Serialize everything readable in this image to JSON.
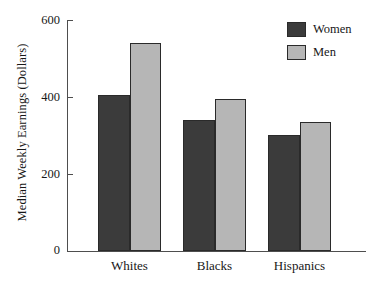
{
  "chart_data": {
    "type": "bar",
    "title": "",
    "xlabel": "",
    "ylabel": "Median Weekly Earnings (Dollars)",
    "categories": [
      "Whites",
      "Blacks",
      "Hispanics"
    ],
    "series": [
      {
        "name": "Women",
        "color": "#3b3b3b",
        "values": [
          405,
          340,
          302
        ]
      },
      {
        "name": "Men",
        "color": "#b6b6b6",
        "values": [
          540,
          395,
          335
        ]
      }
    ],
    "ylim": [
      0,
      600
    ],
    "yticks": [
      0,
      200,
      400,
      600
    ],
    "ytick_labels": [
      "0",
      "200",
      "400",
      "600"
    ],
    "grid": false,
    "legend_position": "top-right",
    "legend_entries": [
      "Women",
      "Men"
    ]
  },
  "axis": {
    "y_title": "Median Weekly Earnings (Dollars)",
    "tick_600": "600",
    "tick_400": "400",
    "tick_200": "200",
    "tick_0": "0"
  },
  "categories": {
    "c0": "Whites",
    "c1": "Blacks",
    "c2": "Hispanics"
  },
  "legend": {
    "women_label": "Women",
    "men_label": "Men"
  }
}
